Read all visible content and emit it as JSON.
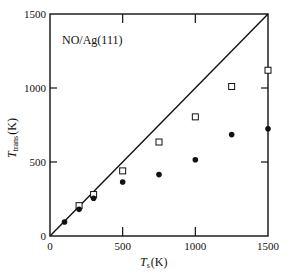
{
  "chart_data": {
    "type": "scatter",
    "title": "",
    "annotation": "NO/Ag(111)",
    "xlabel": "T_s (K)",
    "xlabel_main": "T",
    "xlabel_sub": "s",
    "xlabel_unit": "(K)",
    "ylabel": "T_trans (K)",
    "ylabel_main": "T",
    "ylabel_sub": "trans",
    "ylabel_unit": "(K)",
    "xlim": [
      0,
      1500
    ],
    "ylim": [
      0,
      1500
    ],
    "xticks": [
      0,
      500,
      1000,
      1500
    ],
    "yticks": [
      0,
      500,
      1000,
      1500
    ],
    "xtick_labels": [
      "0",
      "500",
      "1000",
      "1500"
    ],
    "ytick_labels": [
      "0",
      "500",
      "1000",
      "1500"
    ],
    "grid": false,
    "legend": "none",
    "reference_line": {
      "name": "T_trans = T_s",
      "x": [
        0,
        1500
      ],
      "y": [
        0,
        1500
      ]
    },
    "series": [
      {
        "name": "open squares",
        "marker": "open-square",
        "x": [
          200,
          300,
          500,
          750,
          1000,
          1250,
          1500
        ],
        "y": [
          205,
          280,
          440,
          635,
          805,
          1010,
          1120
        ]
      },
      {
        "name": "filled circles",
        "marker": "filled-circle",
        "x": [
          100,
          200,
          300,
          500,
          750,
          1000,
          1250,
          1500
        ],
        "y": [
          95,
          180,
          255,
          365,
          415,
          515,
          685,
          725
        ]
      }
    ]
  }
}
